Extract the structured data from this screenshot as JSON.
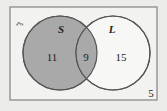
{
  "diagram": {
    "universal_symbol": "ξ",
    "sets": [
      {
        "label": "S",
        "shaded": true
      },
      {
        "label": "L",
        "shaded": false
      }
    ],
    "regions": {
      "only_S": "11",
      "S_and_L": "9",
      "only_L": "15",
      "outside": "5"
    },
    "colors": {
      "background": "#ececea",
      "frame": "#8a8a8a",
      "shade": "#a9a9a9",
      "outline": "#555555"
    }
  }
}
